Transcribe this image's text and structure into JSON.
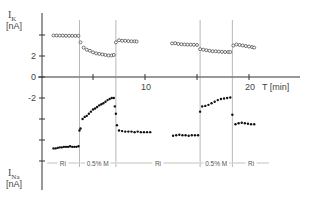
{
  "chart_data": {
    "type": "scatter",
    "title": "",
    "xlabel": "T [min]",
    "xlim": [
      0,
      24
    ],
    "x_ticks": [
      5,
      10,
      15,
      20
    ],
    "x_tick_labels": [
      "",
      "10",
      "",
      "20"
    ],
    "panels": [
      {
        "name": "I_K",
        "ylabel_main": "I",
        "ylabel_sub": "K",
        "ylabel_unit": "[nA]",
        "ylim": [
          0,
          4.5
        ],
        "y_ticks": [
          0,
          2,
          4
        ],
        "y_tick_labels": [
          "0",
          "2",
          ""
        ],
        "marker": "open-circle",
        "series": [
          {
            "segment": "Ri",
            "x": [
              1.2,
              1.5,
              1.8,
              2.1,
              2.4,
              2.7,
              3.0,
              3.3,
              3.6
            ],
            "y": [
              3.95,
              3.95,
              3.94,
              3.94,
              3.93,
              3.93,
              3.93,
              3.92,
              3.92
            ]
          },
          {
            "segment": "0.5% M",
            "x": [
              3.8,
              4.1,
              4.4,
              4.7,
              5.0,
              5.3,
              5.6,
              5.9,
              6.2,
              6.5,
              6.8,
              7.0
            ],
            "y": [
              3.3,
              2.8,
              2.6,
              2.5,
              2.35,
              2.25,
              2.2,
              2.15,
              2.1,
              2.05,
              2.05,
              2.1
            ]
          },
          {
            "segment": "Ri",
            "x": [
              7.2,
              7.5,
              7.8,
              8.1,
              8.4,
              8.7,
              9.0,
              9.2
            ],
            "y": [
              3.3,
              3.5,
              3.45,
              3.45,
              3.42,
              3.4,
              3.4,
              3.38
            ]
          },
          {
            "segment": "Ri",
            "x": [
              12.6,
              12.9,
              13.2,
              13.5,
              13.8,
              14.1,
              14.4,
              14.7,
              15.0
            ],
            "y": [
              3.2,
              3.22,
              3.15,
              3.12,
              3.1,
              3.08,
              3.08,
              3.07,
              3.05
            ]
          },
          {
            "segment": "0.5% M",
            "x": [
              15.3,
              15.6,
              15.9,
              16.2,
              16.5,
              16.8,
              17.1,
              17.4,
              17.7,
              18.0,
              18.2
            ],
            "y": [
              2.65,
              2.6,
              2.55,
              2.5,
              2.45,
              2.45,
              2.42,
              2.4,
              2.38,
              2.38,
              2.38
            ]
          },
          {
            "segment": "Ri",
            "x": [
              18.5,
              18.8,
              19.1,
              19.4,
              19.7,
              20.0,
              20.3,
              20.5
            ],
            "y": [
              3.0,
              3.1,
              3.05,
              3.0,
              2.95,
              2.9,
              2.85,
              2.8
            ]
          }
        ]
      },
      {
        "name": "I_Na",
        "ylabel_main": "I",
        "ylabel_sub": "Na",
        "ylabel_unit": "[nA]",
        "ylim": [
          -8.3,
          0
        ],
        "y_ticks": [
          -2,
          -4,
          -6,
          -8
        ],
        "y_tick_labels": [
          "-2",
          "",
          "",
          ""
        ],
        "marker": "filled-dot",
        "series": [
          {
            "segment": "Ri",
            "x": [
              1.2,
              1.4,
              1.6,
              1.8,
              2.0,
              2.2,
              2.4,
              2.6,
              2.8,
              3.0,
              3.2,
              3.4,
              3.6
            ],
            "y": [
              -6.8,
              -6.8,
              -6.75,
              -6.7,
              -6.7,
              -6.65,
              -6.65,
              -6.65,
              -6.6,
              -6.65,
              -6.65,
              -6.65,
              -6.6
            ]
          },
          {
            "segment": "0.5% M",
            "x": [
              3.7,
              3.8,
              4.0,
              4.2,
              4.4,
              4.6,
              4.8,
              5.0,
              5.2,
              5.4,
              5.6,
              5.8,
              6.0,
              6.2,
              6.4,
              6.6,
              6.8,
              7.0
            ],
            "y": [
              -5.1,
              -4.9,
              -4.0,
              -3.8,
              -3.7,
              -3.5,
              -3.3,
              -3.1,
              -3.0,
              -2.85,
              -2.7,
              -2.6,
              -2.5,
              -2.35,
              -2.2,
              -2.1,
              -2.0,
              -2.0
            ]
          },
          {
            "segment": "transition",
            "x": [
              7.1,
              7.2,
              7.3
            ],
            "y": [
              -2.8,
              -3.5,
              -4.6
            ]
          },
          {
            "segment": "Ri",
            "x": [
              7.5,
              7.8,
              8.1,
              8.4,
              8.7,
              9.0,
              9.3,
              9.6,
              9.9,
              10.2,
              10.5
            ],
            "y": [
              -5.1,
              -5.15,
              -5.2,
              -5.2,
              -5.2,
              -5.25,
              -5.2,
              -5.25,
              -5.25,
              -5.25,
              -5.25
            ]
          },
          {
            "segment": "Ri",
            "x": [
              12.7,
              13.0,
              13.3,
              13.6,
              13.9,
              14.2,
              14.5,
              14.8,
              15.1
            ],
            "y": [
              -5.6,
              -5.55,
              -5.5,
              -5.55,
              -5.55,
              -5.6,
              -5.55,
              -5.55,
              -5.55
            ]
          },
          {
            "segment": "0.5% M",
            "x": [
              15.3,
              15.5,
              15.8,
              16.1,
              16.4,
              16.7,
              17.0,
              17.3,
              17.6,
              17.9,
              18.2
            ],
            "y": [
              -3.3,
              -2.8,
              -2.75,
              -2.65,
              -2.5,
              -2.35,
              -2.2,
              -2.1,
              -2.05,
              -2.0,
              -1.95
            ]
          },
          {
            "segment": "transition",
            "x": [
              18.4
            ],
            "y": [
              -3.6
            ]
          },
          {
            "segment": "Ri",
            "x": [
              18.7,
              19.0,
              19.3,
              19.6,
              19.9,
              20.2,
              20.5
            ],
            "y": [
              -4.5,
              -4.4,
              -4.35,
              -4.4,
              -4.45,
              -4.5,
              -4.5
            ]
          }
        ]
      }
    ],
    "solution_changes_at_T": [
      3.7,
      7.2,
      15.3,
      18.4
    ],
    "segment_labels": [
      {
        "label": "Ri",
        "from": 0.5,
        "to": 3.7
      },
      {
        "label": "0.5% M",
        "from": 3.7,
        "to": 7.2
      },
      {
        "label": "Ri",
        "from": 7.2,
        "to": 15.3
      },
      {
        "label": "0.5% M",
        "from": 15.3,
        "to": 18.4
      },
      {
        "label": "Ri",
        "from": 18.4,
        "to": 22
      }
    ]
  }
}
